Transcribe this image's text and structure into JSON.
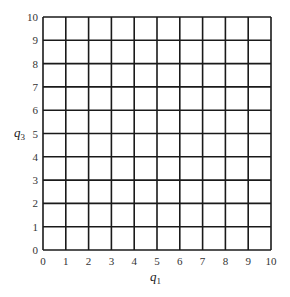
{
  "chart_data": {
    "type": "scatter",
    "title": "",
    "xlabel": "q1",
    "ylabel": "q3",
    "xlabel_main": "q",
    "xlabel_sub": "1",
    "ylabel_main": "q",
    "ylabel_sub": "3",
    "xlim": [
      0,
      10
    ],
    "ylim": [
      0,
      10
    ],
    "x_ticks": [
      "0",
      "1",
      "2",
      "3",
      "4",
      "5",
      "6",
      "7",
      "8",
      "9",
      "10"
    ],
    "y_ticks": [
      "0",
      "1",
      "2",
      "3",
      "4",
      "5",
      "6",
      "7",
      "8",
      "9",
      "10"
    ],
    "grid": true,
    "grid_step": 1,
    "series": [],
    "legend": null
  },
  "layout": {
    "plot_left": 43,
    "plot_top": 17,
    "plot_right": 271,
    "plot_bottom": 250,
    "line_color": "#1a1a1a"
  }
}
